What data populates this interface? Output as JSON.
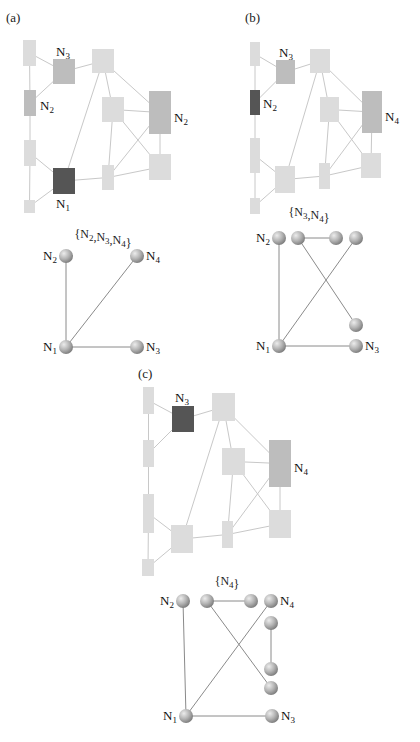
{
  "figure": {
    "width": 420,
    "height": 742,
    "colors": {
      "light": "#dcdcdc",
      "medium": "#bdbdbd",
      "dark": "#555555",
      "rect_edge": "#c8c8c8",
      "graph_edge": "#8a8a8a",
      "sphere_light": "#e6e6e6",
      "sphere_dark": "#8c8c8c"
    },
    "panels": [
      {
        "id": "a",
        "label": "(a)",
        "label_pos": [
          6,
          22
        ],
        "layout": {
          "nodes": [
            {
              "id": "r1",
              "x": 23,
              "y": 40,
              "w": 13,
              "h": 26,
              "shade": "light"
            },
            {
              "id": "r2",
              "x": 53,
              "y": 59,
              "w": 22,
              "h": 25,
              "shade": "medium",
              "label": "N",
              "sub": "3",
              "lx": 56,
              "ly": 56
            },
            {
              "id": "r3",
              "x": 92,
              "y": 49,
              "w": 22,
              "h": 24,
              "shade": "light"
            },
            {
              "id": "r4",
              "x": 24,
              "y": 90,
              "w": 12,
              "h": 26,
              "shade": "medium",
              "label": "N",
              "sub": "2",
              "lx": 40,
              "ly": 110
            },
            {
              "id": "r5",
              "x": 102,
              "y": 97,
              "w": 22,
              "h": 25,
              "shade": "light"
            },
            {
              "id": "r6",
              "x": 149,
              "y": 91,
              "w": 22,
              "h": 43,
              "shade": "medium",
              "label": "N",
              "sub": "2",
              "lx": 174,
              "ly": 122
            },
            {
              "id": "r7",
              "x": 24,
              "y": 140,
              "w": 12,
              "h": 26,
              "shade": "light"
            },
            {
              "id": "r8",
              "x": 53,
              "y": 168,
              "w": 22,
              "h": 26,
              "shade": "dark",
              "label": "N",
              "sub": "1",
              "lx": 56,
              "ly": 208
            },
            {
              "id": "r9",
              "x": 24,
              "y": 200,
              "w": 11,
              "h": 13,
              "shade": "light"
            },
            {
              "id": "r10",
              "x": 102,
              "y": 165,
              "w": 12,
              "h": 25,
              "shade": "light"
            },
            {
              "id": "r11",
              "x": 149,
              "y": 154,
              "w": 22,
              "h": 26,
              "shade": "light"
            }
          ],
          "edges": [
            [
              "r1",
              "r4"
            ],
            [
              "r1",
              "r2"
            ],
            [
              "r4",
              "r2"
            ],
            [
              "r2",
              "r3"
            ],
            [
              "r3",
              "r8"
            ],
            [
              "r3",
              "r5"
            ],
            [
              "r3",
              "r6"
            ],
            [
              "r4",
              "r7"
            ],
            [
              "r7",
              "r9"
            ],
            [
              "r7",
              "r8"
            ],
            [
              "r9",
              "r8"
            ],
            [
              "r8",
              "r10"
            ],
            [
              "r5",
              "r10"
            ],
            [
              "r5",
              "r6"
            ],
            [
              "r5",
              "r11"
            ],
            [
              "r10",
              "r6"
            ],
            [
              "r10",
              "r11"
            ],
            [
              "r6",
              "r11"
            ]
          ]
        },
        "graph": {
          "set_label": "{N2,N3,N4}",
          "set_parts": [
            [
              "{N",
              "2"
            ],
            [
              ",N",
              "3"
            ],
            [
              ",N",
              "4"
            ],
            [
              "}",
              ""
            ]
          ],
          "set_pos": [
            103,
            238
          ],
          "spheres": [
            {
              "id": "N2",
              "x": 66,
              "y": 256,
              "label": "N",
              "sub": "2",
              "side": "left"
            },
            {
              "id": "N4",
              "x": 137,
              "y": 256,
              "label": "N",
              "sub": "4",
              "side": "right"
            },
            {
              "id": "N1",
              "x": 66,
              "y": 347,
              "label": "N",
              "sub": "1",
              "side": "left"
            },
            {
              "id": "N3",
              "x": 137,
              "y": 347,
              "label": "N",
              "sub": "3",
              "side": "right"
            }
          ],
          "edges": [
            [
              "N1",
              "N2"
            ],
            [
              "N1",
              "N4"
            ],
            [
              "N1",
              "N3"
            ]
          ]
        }
      },
      {
        "id": "b",
        "label": "(b)",
        "label_pos": [
          245,
          22
        ],
        "layout": {
          "nodes": [
            {
              "id": "r1",
              "x": 250,
              "y": 42,
              "w": 10,
              "h": 24,
              "shade": "light"
            },
            {
              "id": "r2",
              "x": 276,
              "y": 60,
              "w": 19,
              "h": 24,
              "shade": "medium",
              "label": "N",
              "sub": "3",
              "lx": 279,
              "ly": 57
            },
            {
              "id": "r3",
              "x": 310,
              "y": 49,
              "w": 20,
              "h": 24,
              "shade": "light"
            },
            {
              "id": "r4",
              "x": 250,
              "y": 90,
              "w": 10,
              "h": 25,
              "shade": "dark",
              "label": "N",
              "sub": "2",
              "lx": 263,
              "ly": 108
            },
            {
              "id": "r5",
              "x": 320,
              "y": 97,
              "w": 19,
              "h": 25,
              "shade": "light"
            },
            {
              "id": "r6",
              "x": 362,
              "y": 91,
              "w": 20,
              "h": 42,
              "shade": "medium",
              "label": "N",
              "sub": "4",
              "lx": 385,
              "ly": 121
            },
            {
              "id": "r7",
              "x": 250,
              "y": 138,
              "w": 10,
              "h": 35,
              "shade": "light"
            },
            {
              "id": "r8",
              "x": 275,
              "y": 166,
              "w": 20,
              "h": 27,
              "shade": "light"
            },
            {
              "id": "r9",
              "x": 250,
              "y": 198,
              "w": 10,
              "h": 16,
              "shade": "light"
            },
            {
              "id": "r10",
              "x": 319,
              "y": 163,
              "w": 11,
              "h": 26,
              "shade": "light"
            },
            {
              "id": "r11",
              "x": 361,
              "y": 153,
              "w": 20,
              "h": 25,
              "shade": "light"
            }
          ],
          "edges": [
            [
              "r1",
              "r4"
            ],
            [
              "r1",
              "r2"
            ],
            [
              "r4",
              "r2"
            ],
            [
              "r2",
              "r3"
            ],
            [
              "r3",
              "r8"
            ],
            [
              "r3",
              "r5"
            ],
            [
              "r3",
              "r6"
            ],
            [
              "r4",
              "r7"
            ],
            [
              "r7",
              "r9"
            ],
            [
              "r7",
              "r8"
            ],
            [
              "r9",
              "r8"
            ],
            [
              "r8",
              "r10"
            ],
            [
              "r5",
              "r10"
            ],
            [
              "r5",
              "r6"
            ],
            [
              "r5",
              "r11"
            ],
            [
              "r10",
              "r6"
            ],
            [
              "r10",
              "r11"
            ],
            [
              "r6",
              "r11"
            ]
          ]
        },
        "graph": {
          "set_label": "{N3,N4}",
          "set_parts": [
            [
              "{N",
              "3"
            ],
            [
              ",N",
              "4"
            ],
            [
              "}",
              ""
            ]
          ],
          "set_pos": [
            309,
            216
          ],
          "spheres": [
            {
              "id": "N2",
              "x": 279,
              "y": 238,
              "label": "N",
              "sub": "2",
              "side": "left"
            },
            {
              "id": "s2",
              "x": 298,
              "y": 238
            },
            {
              "id": "s3",
              "x": 336,
              "y": 238
            },
            {
              "id": "s4",
              "x": 356,
              "y": 238
            },
            {
              "id": "s5",
              "x": 356,
              "y": 325
            },
            {
              "id": "N1",
              "x": 279,
              "y": 346,
              "label": "N",
              "sub": "1",
              "side": "left"
            },
            {
              "id": "N3",
              "x": 356,
              "y": 346,
              "label": "N",
              "sub": "3",
              "side": "right"
            }
          ],
          "edges": [
            [
              "N1",
              "N2"
            ],
            [
              "N1",
              "s4"
            ],
            [
              "N1",
              "N3"
            ],
            [
              "s2",
              "s3"
            ],
            [
              "s2",
              "s5"
            ]
          ]
        }
      },
      {
        "id": "c",
        "label": "(c)",
        "label_pos": [
          138,
          378
        ],
        "layout": {
          "nodes": [
            {
              "id": "r1",
              "x": 143,
              "y": 387,
              "w": 11,
              "h": 27,
              "shade": "light"
            },
            {
              "id": "r2",
              "x": 172,
              "y": 406,
              "w": 22,
              "h": 26,
              "shade": "dark",
              "label": "N",
              "sub": "3",
              "lx": 175,
              "ly": 402
            },
            {
              "id": "r3",
              "x": 212,
              "y": 393,
              "w": 23,
              "h": 28,
              "shade": "light"
            },
            {
              "id": "r4",
              "x": 143,
              "y": 440,
              "w": 11,
              "h": 27,
              "shade": "light"
            },
            {
              "id": "r5",
              "x": 222,
              "y": 448,
              "w": 23,
              "h": 27,
              "shade": "light"
            },
            {
              "id": "r6",
              "x": 269,
              "y": 440,
              "w": 22,
              "h": 47,
              "shade": "medium",
              "label": "N",
              "sub": "4",
              "lx": 294,
              "ly": 472
            },
            {
              "id": "r7",
              "x": 143,
              "y": 494,
              "w": 11,
              "h": 39,
              "shade": "light"
            },
            {
              "id": "r8",
              "x": 171,
              "y": 525,
              "w": 22,
              "h": 28,
              "shade": "light"
            },
            {
              "id": "r9",
              "x": 142,
              "y": 559,
              "w": 12,
              "h": 17,
              "shade": "light"
            },
            {
              "id": "r10",
              "x": 222,
              "y": 521,
              "w": 11,
              "h": 27,
              "shade": "light"
            },
            {
              "id": "r11",
              "x": 269,
              "y": 510,
              "w": 22,
              "h": 28,
              "shade": "light"
            }
          ],
          "edges": [
            [
              "r1",
              "r4"
            ],
            [
              "r1",
              "r2"
            ],
            [
              "r4",
              "r2"
            ],
            [
              "r2",
              "r3"
            ],
            [
              "r3",
              "r8"
            ],
            [
              "r3",
              "r5"
            ],
            [
              "r3",
              "r6"
            ],
            [
              "r4",
              "r7"
            ],
            [
              "r7",
              "r9"
            ],
            [
              "r7",
              "r8"
            ],
            [
              "r9",
              "r8"
            ],
            [
              "r8",
              "r10"
            ],
            [
              "r5",
              "r10"
            ],
            [
              "r5",
              "r6"
            ],
            [
              "r5",
              "r11"
            ],
            [
              "r10",
              "r6"
            ],
            [
              "r10",
              "r11"
            ],
            [
              "r6",
              "r11"
            ]
          ]
        },
        "graph": {
          "set_label": "{N4}",
          "set_parts": [
            [
              "{N",
              "4"
            ],
            [
              "}",
              ""
            ]
          ],
          "set_pos": [
            227,
            585
          ],
          "spheres": [
            {
              "id": "N2",
              "x": 183,
              "y": 601,
              "label": "N",
              "sub": "2",
              "side": "left"
            },
            {
              "id": "s2",
              "x": 207,
              "y": 601
            },
            {
              "id": "s3",
              "x": 251,
              "y": 601
            },
            {
              "id": "s4",
              "x": 271,
              "y": 601,
              "label": "N",
              "sub": "4",
              "side": "right"
            },
            {
              "id": "s5",
              "x": 271,
              "y": 623
            },
            {
              "id": "s6",
              "x": 271,
              "y": 669
            },
            {
              "id": "s7",
              "x": 271,
              "y": 688
            },
            {
              "id": "N1",
              "x": 186,
              "y": 716,
              "label": "N",
              "sub": "1",
              "side": "left"
            },
            {
              "id": "N3",
              "x": 272,
              "y": 716,
              "label": "N",
              "sub": "3",
              "side": "right"
            }
          ],
          "edges": [
            [
              "N1",
              "N2"
            ],
            [
              "N1",
              "s4"
            ],
            [
              "N1",
              "N3"
            ],
            [
              "s2",
              "s3"
            ],
            [
              "s2",
              "s7"
            ],
            [
              "s5",
              "s6"
            ]
          ]
        }
      }
    ]
  }
}
